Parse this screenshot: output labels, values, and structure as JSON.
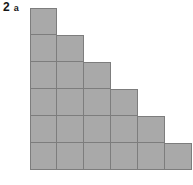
{
  "figure": {
    "label_number": "2",
    "label_part": "a",
    "type": "staircase-block-diagram",
    "rows": 6,
    "max_columns": 6,
    "row_counts": [
      1,
      2,
      3,
      4,
      5,
      6
    ],
    "total_squares": 21,
    "fill_color": "#a9a9a9",
    "border_color": "#7d7d7d",
    "background_color": "#ffffff",
    "cell_size_px": 27
  },
  "chart_data": {
    "type": "bar",
    "title": "2 a",
    "categories": [
      "1",
      "2",
      "3",
      "4",
      "5",
      "6"
    ],
    "values": [
      6,
      5,
      4,
      3,
      2,
      1
    ],
    "xlabel": "",
    "ylabel": "",
    "ylim": [
      0,
      6
    ],
    "grid": true,
    "legend": "none",
    "annotations": [
      "Staircase of unit squares; column heights decrease by 1 from left to right"
    ]
  }
}
